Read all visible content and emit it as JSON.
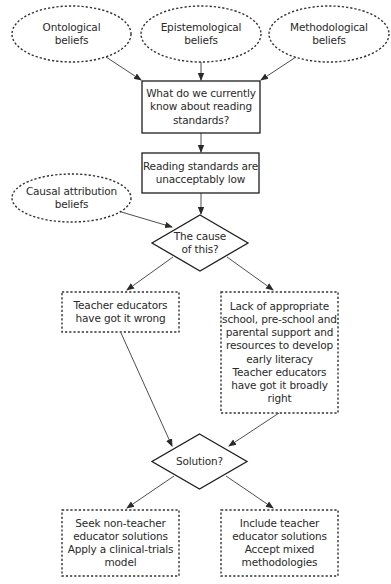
{
  "diagram": {
    "colors": {
      "stroke": "#1e1e1e",
      "dashed_stroke": "#333333",
      "arrow": "#3a3a3a",
      "text": "#2a2a2a",
      "background": "#ffffff"
    },
    "nodes": {
      "ontological": {
        "shape": "ellipse",
        "style": "dashed",
        "text": "Ontological\nbeliefs"
      },
      "epistemological": {
        "shape": "ellipse",
        "style": "dashed",
        "text": "Epistemological\nbeliefs"
      },
      "methodological": {
        "shape": "ellipse",
        "style": "dashed",
        "text": "Methodological\nbeliefs"
      },
      "current_knowledge": {
        "shape": "rect",
        "style": "solid",
        "text": "What do we currently\nknow about reading\nstandards?"
      },
      "standards_low": {
        "shape": "rect",
        "style": "solid",
        "text": "Reading standards are\nunacceptably low"
      },
      "causal_attribution": {
        "shape": "ellipse",
        "style": "dashed",
        "text": "Causal attribution\nbeliefs"
      },
      "cause_decision": {
        "shape": "diamond",
        "style": "solid",
        "text": "The cause\nof this?"
      },
      "educators_wrong": {
        "shape": "rect",
        "style": "dashed",
        "text": "Teacher educators\nhave got it wrong"
      },
      "lack_support": {
        "shape": "rect",
        "style": "dashed",
        "text": "Lack of appropriate\nschool, pre-school and\nparental support and\nresources to develop\nearly literacy\nTeacher educators\nhave got it broadly\nright"
      },
      "solution_decision": {
        "shape": "diamond",
        "style": "solid",
        "text": "Solution?"
      },
      "non_teacher_solutions": {
        "shape": "rect",
        "style": "dashed",
        "text": "Seek non-teacher\neducator solutions\nApply a clinical-trials\nmodel"
      },
      "include_teacher_solutions": {
        "shape": "rect",
        "style": "dashed",
        "text": "Include teacher\neducator solutions\nAccept mixed\nmethodologies"
      }
    },
    "edges": [
      {
        "from": "ontological",
        "to": "current_knowledge"
      },
      {
        "from": "epistemological",
        "to": "current_knowledge"
      },
      {
        "from": "methodological",
        "to": "current_knowledge"
      },
      {
        "from": "current_knowledge",
        "to": "standards_low"
      },
      {
        "from": "standards_low",
        "to": "cause_decision"
      },
      {
        "from": "causal_attribution",
        "to": "cause_decision"
      },
      {
        "from": "cause_decision",
        "to": "educators_wrong"
      },
      {
        "from": "cause_decision",
        "to": "lack_support"
      },
      {
        "from": "educators_wrong",
        "to": "solution_decision"
      },
      {
        "from": "lack_support",
        "to": "solution_decision"
      },
      {
        "from": "solution_decision",
        "to": "non_teacher_solutions"
      },
      {
        "from": "solution_decision",
        "to": "include_teacher_solutions"
      }
    ]
  }
}
